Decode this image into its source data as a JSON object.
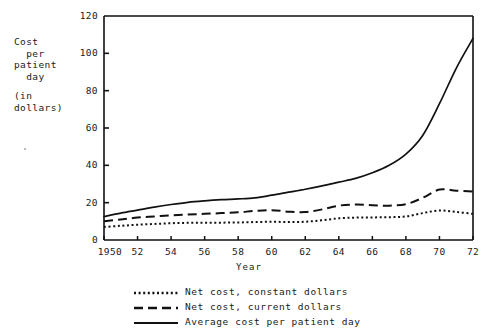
{
  "axis_titles": {
    "y_line1": "Cost\n  per\npatient\n  day",
    "y_line2": "(in\ndollars)",
    "x": "Year"
  },
  "legend": [
    {
      "label": "Net cost, constant dollars",
      "style": "dotted"
    },
    {
      "label": "Net cost, current dollars",
      "style": "dashed"
    },
    {
      "label": "Average cost per patient day",
      "style": "solid"
    }
  ],
  "yticks": [
    "0",
    "20",
    "40",
    "60",
    "80",
    "100",
    "120"
  ],
  "xticks": [
    "1950",
    "52",
    "54",
    "56",
    "58",
    "60",
    "62",
    "64",
    "66",
    "68",
    "70",
    "72"
  ],
  "chart_data": {
    "type": "line",
    "title": "",
    "xlabel": "Year",
    "ylabel": "Cost per patient day (in dollars)",
    "xlim": [
      1950,
      1972
    ],
    "ylim": [
      0,
      120
    ],
    "yticks": [
      0,
      20,
      40,
      60,
      80,
      100,
      120
    ],
    "xticks": [
      1950,
      1952,
      1954,
      1956,
      1958,
      1960,
      1962,
      1964,
      1966,
      1968,
      1970,
      1972
    ],
    "grid": false,
    "legend_position": "below",
    "x": [
      1950,
      1951,
      1952,
      1953,
      1954,
      1955,
      1956,
      1957,
      1958,
      1959,
      1960,
      1961,
      1962,
      1963,
      1964,
      1965,
      1966,
      1967,
      1968,
      1969,
      1970,
      1971,
      1972
    ],
    "series": [
      {
        "name": "Net cost, constant dollars",
        "style": "dotted",
        "values": [
          7.0,
          7.6,
          8.2,
          8.6,
          9.0,
          9.2,
          9.3,
          9.3,
          9.4,
          9.6,
          9.8,
          9.6,
          9.8,
          10.6,
          11.6,
          12.0,
          12.1,
          12.2,
          12.6,
          14.4,
          15.8,
          15.0,
          14.0
        ]
      },
      {
        "name": "Net cost, current dollars",
        "style": "dashed",
        "values": [
          10.0,
          11.0,
          12.0,
          12.6,
          13.2,
          13.6,
          14.0,
          14.4,
          14.8,
          15.6,
          16.0,
          15.2,
          15.0,
          16.4,
          18.4,
          19.0,
          18.6,
          18.4,
          19.2,
          22.6,
          27.0,
          26.4,
          26.0
        ]
      },
      {
        "name": "Average cost per patient day",
        "style": "solid",
        "values": [
          12.6,
          14.4,
          16.0,
          17.6,
          19.0,
          20.2,
          21.0,
          21.6,
          22.0,
          22.6,
          24.0,
          25.6,
          27.2,
          29.0,
          31.0,
          33.0,
          36.0,
          40.0,
          46.0,
          56.0,
          73.0,
          92.0,
          108.0
        ]
      }
    ]
  },
  "colors": {
    "line": "#111111",
    "text": "#1a1a1a",
    "background": "#ffffff"
  }
}
